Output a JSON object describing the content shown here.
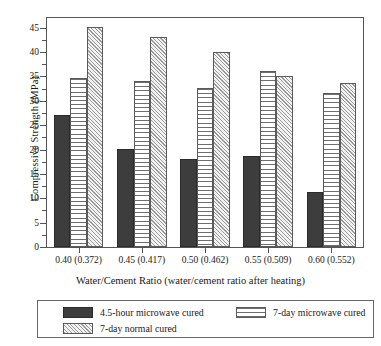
{
  "chart_data": {
    "type": "bar",
    "title": "",
    "xlabel": "Water/Cement Ratio (water/cement ratio after heating)",
    "ylabel": "Compressive Strength (MPa)",
    "categories": [
      "0.40 (0.372)",
      "0.45 (0.417)",
      "0.50 (0.462)",
      "0.55 (0.509)",
      "0.60 (0.552)"
    ],
    "series": [
      {
        "name": "4.5-hour microwave cured",
        "values": [
          27.0,
          20.1,
          18.1,
          18.7,
          11.2
        ],
        "fill": "solid-dark",
        "color": "#3d3d3d"
      },
      {
        "name": "7-day microwave cured",
        "values": [
          34.6,
          34.1,
          32.6,
          36.1,
          31.7
        ],
        "fill": "horizontal-lines",
        "color": "#ffffff"
      },
      {
        "name": "7-day normal cured",
        "values": [
          45.1,
          43.1,
          40.1,
          35.2,
          33.7
        ],
        "fill": "diagonal-hatch",
        "color": "#f2f2f2"
      }
    ],
    "ylim": [
      0,
      47
    ],
    "yticks": [
      0,
      5,
      10,
      15,
      20,
      25,
      30,
      35,
      40,
      45
    ],
    "ytick_labels": [
      "0",
      "5",
      "10",
      "15",
      "20",
      "25",
      "30",
      "35",
      "40",
      "45"
    ],
    "yminor_ticks": [
      2.5,
      7.5,
      12.5,
      17.5,
      22.5,
      27.5,
      32.5,
      37.5,
      42.5
    ],
    "grid": false,
    "legend_position": "below-axes",
    "axis_color": "#555555",
    "background": "#ffffff"
  },
  "legend": {
    "entries": [
      {
        "label": "4.5-hour microwave cured"
      },
      {
        "label": "7-day microwave cured"
      },
      {
        "label": "7-day normal cured"
      }
    ]
  }
}
